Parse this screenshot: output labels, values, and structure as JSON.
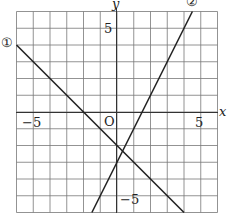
{
  "chart_data": {
    "type": "line",
    "title": "",
    "xlabel": "x",
    "ylabel": "y",
    "origin_label": "O",
    "xlim": [
      -6,
      6
    ],
    "ylim": [
      -6,
      6
    ],
    "grid": true,
    "grid_step": 1,
    "x_ticks": [
      {
        "value": -5,
        "label": "−5"
      },
      {
        "value": 5,
        "label": "5"
      }
    ],
    "y_ticks": [
      {
        "value": 5,
        "label": "5"
      },
      {
        "value": -5,
        "label": "−5"
      }
    ],
    "series": [
      {
        "name": "①",
        "equation": "y = -x - 2",
        "points": [
          [
            -6,
            4
          ],
          [
            -2,
            0
          ],
          [
            0,
            -2
          ],
          [
            4,
            -6
          ]
        ]
      },
      {
        "name": "②",
        "equation": "y = 2x - 3",
        "points": [
          [
            -1.5,
            -6
          ],
          [
            0,
            -3
          ],
          [
            1.5,
            0
          ],
          [
            4.5,
            6
          ]
        ]
      }
    ],
    "intersection": [
      0.333,
      -2.333
    ]
  },
  "labels": {
    "x_axis": "x",
    "y_axis": "y",
    "origin": "O",
    "x_neg5": "−5",
    "x_pos5": "5",
    "y_pos5": "5",
    "y_neg5": "−5",
    "line1": "①",
    "line2": "②"
  }
}
